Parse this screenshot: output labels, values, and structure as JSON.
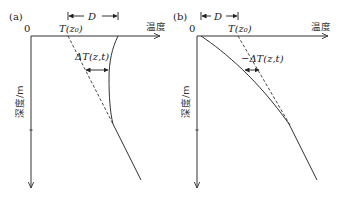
{
  "figure": {
    "panels": [
      {
        "id": "a",
        "panel_label": "(a)",
        "origin_label": "0",
        "x_axis_label": "温度",
        "y_axis_label": "深度/m",
        "span_label": "D",
        "reference_label": "T(z₀)",
        "delta_label": "ΔT(z,t)"
      },
      {
        "id": "b",
        "panel_label": "(b)",
        "origin_label": "0",
        "x_axis_label": "温度",
        "y_axis_label": "深度/m",
        "span_label": "D",
        "reference_label": "T(z₀)",
        "delta_label": "−ΔT(z,t)"
      }
    ]
  }
}
